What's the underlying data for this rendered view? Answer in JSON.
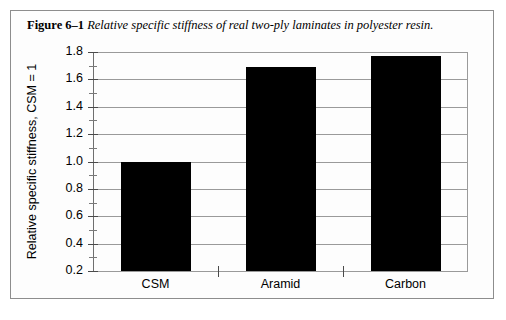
{
  "figure": {
    "caption_label": "Figure 6–1",
    "caption_text": "Relative specific stiffness of real two-ply laminates in polyester resin."
  },
  "chart_data": {
    "type": "bar",
    "title": "Relative specific stiffness of real two-ply laminates in polyester resin",
    "categories": [
      "CSM",
      "Aramid",
      "Carbon"
    ],
    "values": [
      1.0,
      1.69,
      1.77
    ],
    "xlabel": "",
    "ylabel": "Relative specific stiffness, CSM = 1",
    "ylim": [
      0.2,
      1.8
    ],
    "ytick_labels": [
      "1.8",
      "1.6",
      "1.4",
      "1.2",
      "1.0",
      "0.8",
      "0.6",
      "0.4",
      "0.2"
    ],
    "ytick_values": [
      1.8,
      1.6,
      1.4,
      1.2,
      1.0,
      0.8,
      0.6,
      0.4,
      0.2
    ],
    "yminor_values": [
      1.7,
      1.5,
      1.3,
      1.1,
      0.9,
      0.7,
      0.5,
      0.3
    ],
    "grid": true,
    "legend": false,
    "bar_color": "#000000",
    "grid_color": "#9a9a9a",
    "axis_color": "#6f6f6f"
  }
}
